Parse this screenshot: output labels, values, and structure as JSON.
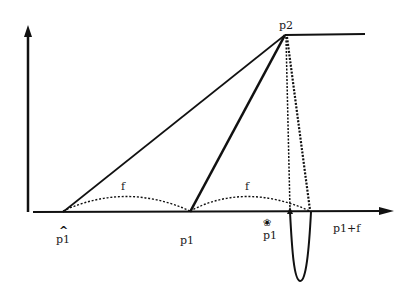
{
  "diagram": {
    "title": "",
    "labels": {
      "p2": "p2",
      "p1_hat": "p1",
      "p1_mid": "p1",
      "p1_star": "p1",
      "p1_plus_f": "p1+f",
      "f_left": "f",
      "f_right": "f",
      "hat_glyph": "^",
      "star_glyph": "❀"
    },
    "colors": {
      "ink": "#111111",
      "background": "#ffffff"
    },
    "points": {
      "origin": [
        28,
        212
      ],
      "p2": [
        285,
        35
      ],
      "p1_hat": [
        63,
        212
      ],
      "p1_mid": [
        190,
        212
      ],
      "p1_star_drop": [
        290,
        212
      ],
      "p1_plus_f": [
        310,
        212
      ]
    }
  }
}
